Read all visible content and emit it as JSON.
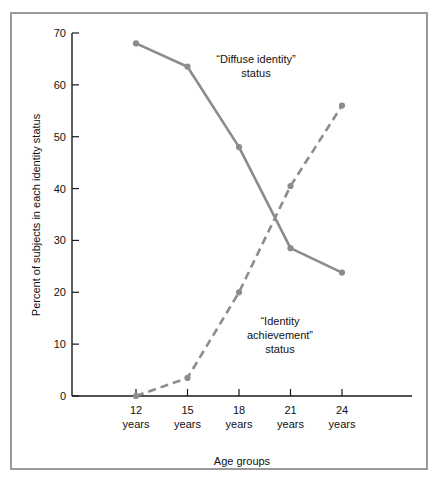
{
  "figure": {
    "background_color": "#ffffff",
    "frame_color": "#9a9a9a",
    "line_color": "#8c8c8c",
    "axis_color": "#1a1a1a"
  },
  "chart_data": {
    "type": "line",
    "title": "",
    "xlabel": "Age groups",
    "ylabel": "Percent of subjects in each identity status",
    "categories": [
      "12 years",
      "15 years",
      "18 years",
      "21 years",
      "24 years"
    ],
    "category_lines": [
      [
        "12",
        "years"
      ],
      [
        "15",
        "years"
      ],
      [
        "18",
        "years"
      ],
      [
        "21",
        "years"
      ],
      [
        "24",
        "years"
      ]
    ],
    "ylim": [
      0,
      70
    ],
    "yticks": [
      0,
      10,
      20,
      30,
      40,
      50,
      60,
      70
    ],
    "ytick_labels": [
      "0",
      "10",
      "20",
      "30",
      "40",
      "50",
      "60",
      "70"
    ],
    "grid": false,
    "legend_position": "inline-annotations",
    "series": [
      {
        "name": "“Diffuse identity” status",
        "style": "solid",
        "color": "#8c8c8c",
        "values": [
          68,
          63.5,
          48,
          28.5,
          23.8
        ]
      },
      {
        "name": "“Identity achievement” status",
        "style": "dashed",
        "color": "#8c8c8c",
        "values": [
          0,
          3.5,
          20,
          40.5,
          56
        ]
      }
    ],
    "annotations": [
      {
        "name": "diffuse-identity-label",
        "lines": [
          "“Diffuse identity”",
          "status"
        ],
        "x_px": 256,
        "y_px": 63
      },
      {
        "name": "identity-achievement-label",
        "lines": [
          "“Identity",
          "achievement”",
          "status"
        ],
        "x_px": 280,
        "y_px": 325
      }
    ]
  },
  "axis": {
    "x_title": "Age groups",
    "y_title": "Percent of subjects in each identity status"
  }
}
